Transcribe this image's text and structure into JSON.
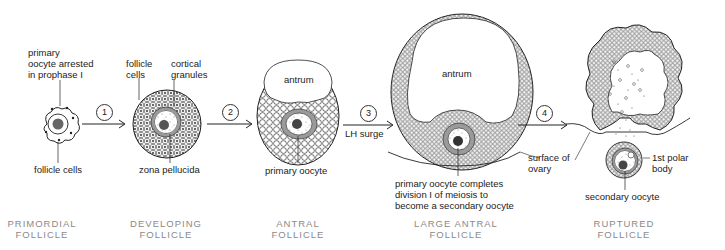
{
  "stages": [
    {
      "title_line1": "PRIMORDIAL",
      "title_line2": "FOLLICLE"
    },
    {
      "title_line1": "DEVELOPING",
      "title_line2": "FOLLICLE"
    },
    {
      "title_line1": "ANTRAL",
      "title_line2": "FOLLICLE"
    },
    {
      "title_line1": "LARGE ANTRAL",
      "title_line2": "FOLLICLE"
    },
    {
      "title_line1": "RUPTURED",
      "title_line2": "FOLLICLE"
    }
  ],
  "labels": {
    "primordial_oocyte_1": "primary",
    "primordial_oocyte_2": "oocyte arrested",
    "primordial_oocyte_3": "in prophase I",
    "primordial_follicle_cells": "follicle cells",
    "developing_follicle_cells_1": "follicle",
    "developing_follicle_cells_2": "cells",
    "cortical_granules_1": "cortical",
    "cortical_granules_2": "granules",
    "zona_pellucida": "zona pellucida",
    "antral_antrum": "antrum",
    "primary_oocyte": "primary oocyte",
    "large_antrum": "antrum",
    "meiosis_1": "primary oocyte completes",
    "meiosis_2": "division I of meiosis to",
    "meiosis_3": "become a secondary oocyte",
    "surface_ovary_1": "surface of",
    "surface_ovary_2": "ovary",
    "polar_body_1": "1st polar",
    "polar_body_2": "body",
    "secondary_oocyte": "secondary oocyte"
  },
  "steps": [
    {
      "number": "1",
      "note": ""
    },
    {
      "number": "2",
      "note": ""
    },
    {
      "number": "3",
      "note": "LH surge"
    },
    {
      "number": "4",
      "note": ""
    }
  ],
  "colors": {
    "ink": "#222222",
    "zona": "#9a9a9a",
    "nucleus": "#555555",
    "title": "#8a8a8a"
  }
}
